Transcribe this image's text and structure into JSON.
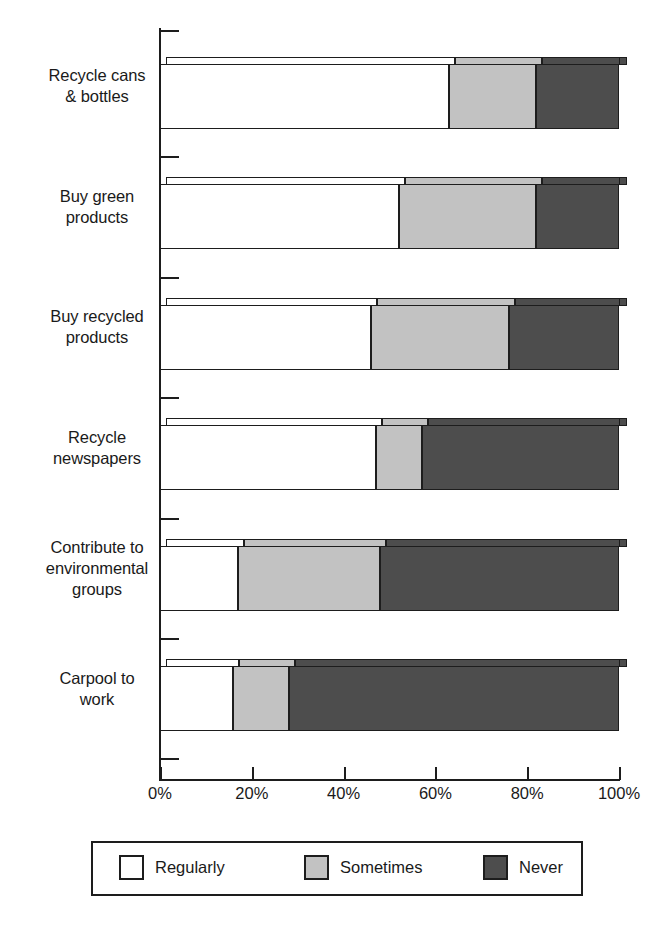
{
  "chart_data": {
    "type": "bar",
    "orientation": "horizontal",
    "stacked": true,
    "stack_mode": "percent",
    "title": "",
    "subtitle": "",
    "xlabel": "",
    "ylabel": "",
    "xlim": [
      0,
      100
    ],
    "grid": false,
    "legend_position": "bottom",
    "categories": [
      "Recycle cans & bottles",
      "Buy green products",
      "Buy recycled products",
      "Recycle newspapers",
      "Contribute to environmental groups",
      "Carpool to work"
    ],
    "category_lines": [
      [
        "Recycle cans",
        "& bottles"
      ],
      [
        "Buy green",
        "products"
      ],
      [
        "Buy recycled",
        "products"
      ],
      [
        "Recycle",
        "newspapers"
      ],
      [
        "Contribute to",
        "environmental",
        "groups"
      ],
      [
        "Carpool to",
        "work"
      ]
    ],
    "series": [
      {
        "name": "Regularly",
        "color": "#ffffff",
        "values": [
          63,
          52,
          46,
          47,
          17,
          16
        ]
      },
      {
        "name": "Sometimes",
        "color": "#c2c2c2",
        "values": [
          19,
          30,
          30,
          10,
          31,
          12
        ]
      },
      {
        "name": "Never",
        "color": "#4d4d4d",
        "values": [
          18,
          18,
          24,
          43,
          52,
          72
        ]
      }
    ],
    "cumulative_boundaries": [
      [
        63,
        82
      ],
      [
        52,
        82
      ],
      [
        46,
        76
      ],
      [
        47,
        57
      ],
      [
        17,
        48
      ],
      [
        16,
        28
      ]
    ],
    "xticks": [
      0,
      20,
      40,
      60,
      80,
      100
    ],
    "xtick_labels": [
      "0%",
      "20%",
      "40%",
      "60%",
      "80%",
      "100%"
    ]
  },
  "legend": {
    "items": [
      {
        "label": "Regularly",
        "swatch": "reg"
      },
      {
        "label": "Sometimes",
        "swatch": "some"
      },
      {
        "label": "Never",
        "swatch": "never"
      }
    ]
  },
  "colors": {
    "regularly": "#ffffff",
    "sometimes": "#c2c2c2",
    "never": "#4d4d4d",
    "axis": "#1d1d1d",
    "background": "#ffffff"
  }
}
